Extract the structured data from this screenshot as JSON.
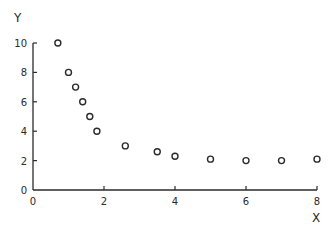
{
  "chart_data": {
    "type": "scatter",
    "title": "",
    "xlabel": "X",
    "ylabel": "Y",
    "xlim": [
      0,
      8
    ],
    "ylim": [
      0,
      10
    ],
    "x_ticks": [
      0,
      2,
      4,
      6,
      8
    ],
    "y_ticks": [
      0,
      2,
      4,
      6,
      8,
      10
    ],
    "grid": false,
    "legend": null,
    "marker": "open-circle",
    "series": [
      {
        "name": "data",
        "points": [
          {
            "x": 0.7,
            "y": 10.0
          },
          {
            "x": 1.0,
            "y": 8.0
          },
          {
            "x": 1.2,
            "y": 7.0
          },
          {
            "x": 1.4,
            "y": 6.0
          },
          {
            "x": 1.6,
            "y": 5.0
          },
          {
            "x": 1.8,
            "y": 4.0
          },
          {
            "x": 2.6,
            "y": 3.0
          },
          {
            "x": 3.5,
            "y": 2.6
          },
          {
            "x": 4.0,
            "y": 2.3
          },
          {
            "x": 5.0,
            "y": 2.1
          },
          {
            "x": 6.0,
            "y": 2.0
          },
          {
            "x": 7.0,
            "y": 2.0
          },
          {
            "x": 8.0,
            "y": 2.1
          }
        ]
      }
    ]
  },
  "labels": {
    "x_axis": "X",
    "y_axis": "Y"
  },
  "colors": {
    "ink": "#2a2a2a",
    "background": "#ffffff"
  }
}
